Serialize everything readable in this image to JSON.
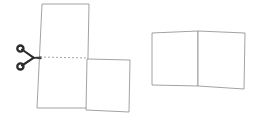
{
  "figure": {
    "width": 263,
    "height": 125,
    "background_color": "#ffffff",
    "outline_color": "#8a8a8a",
    "cut_line_color": "#9a9a9a",
    "scissors_color": "#2b2b2b",
    "caption": ""
  },
  "left_group": {
    "label": "Before cut",
    "shapes": [
      {
        "name": "upper-left-sheet",
        "label": "Upper sheet",
        "points": "42,4 89,4 87,108 37,108"
      },
      {
        "name": "lower-right-sheet",
        "label": "Lower sheet",
        "points": "87,59 130,60 129,112 86,110"
      }
    ],
    "cut_line": {
      "name": "cut-line",
      "label": "Cut line",
      "x1": 40,
      "y1": 57,
      "x2": 88,
      "y2": 58
    },
    "scissors": {
      "name": "scissors",
      "label": "Scissors",
      "x": 18,
      "y": 45,
      "width": 24,
      "height": 24
    }
  },
  "right_group": {
    "label": "After cut",
    "shapes": [
      {
        "name": "result-left-sheet",
        "label": "Left piece",
        "points": "152,33 198,31 198,86 152,85"
      },
      {
        "name": "result-right-sheet",
        "label": "Right piece",
        "points": "198,31 245,33 244,89 198,86"
      }
    ]
  }
}
